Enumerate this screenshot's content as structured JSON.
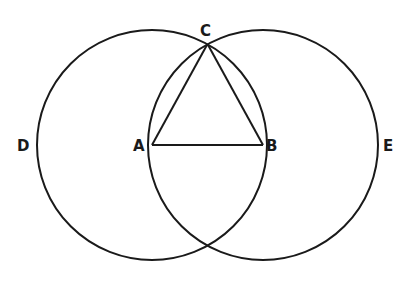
{
  "diagram": {
    "points": {
      "A": {
        "label": "A",
        "x": 152,
        "y": 145
      },
      "B": {
        "label": "B",
        "x": 263,
        "y": 145
      },
      "C": {
        "label": "C",
        "x": 207.5,
        "y": 44
      },
      "D": {
        "label": "D"
      },
      "E": {
        "label": "E"
      }
    },
    "circles": [
      {
        "name": "circle-centered-A",
        "cx": 152,
        "cy": 145,
        "r": 115
      },
      {
        "name": "circle-centered-B",
        "cx": 263,
        "cy": 145,
        "r": 115
      }
    ],
    "segments": [
      {
        "name": "segment-AB",
        "from": "A",
        "to": "B"
      },
      {
        "name": "segment-AC",
        "from": "A",
        "to": "C"
      },
      {
        "name": "segment-BC",
        "from": "B",
        "to": "C"
      }
    ],
    "colors": {
      "ink": "#1a1a1a",
      "paper": "#ffffff"
    }
  }
}
